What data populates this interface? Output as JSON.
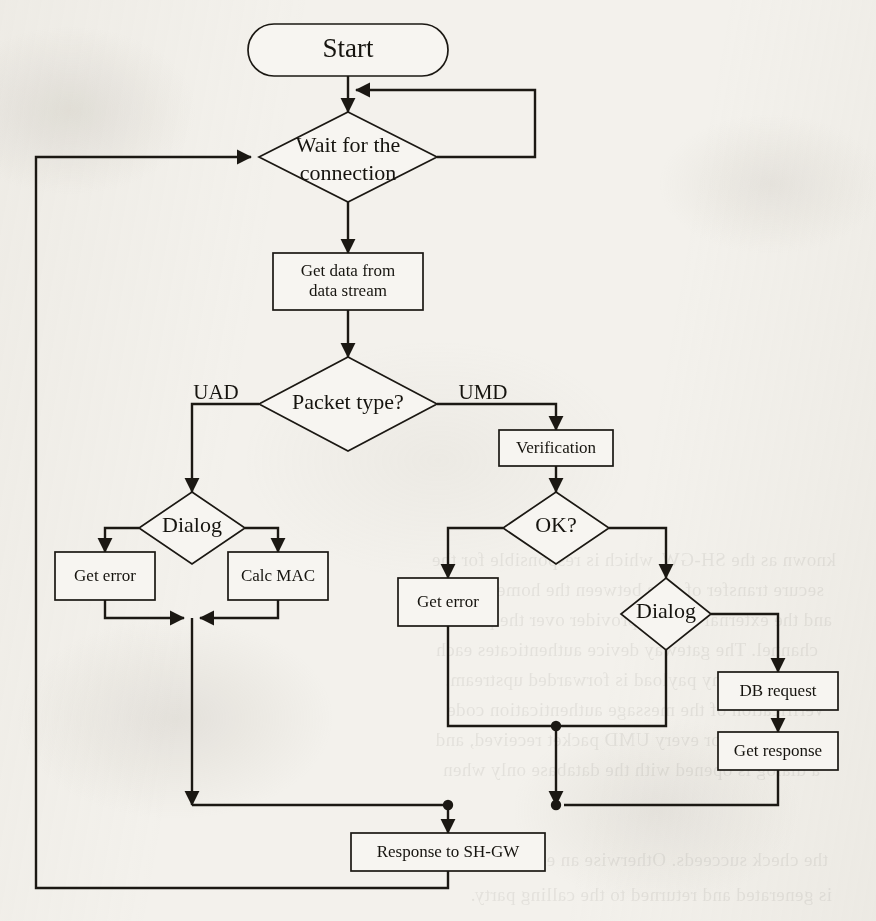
{
  "diagram": {
    "type": "flowchart",
    "colors": {
      "ink": "#1b1813",
      "paper": "#f3f1ec",
      "node_fill": "#f7f5f1"
    },
    "nodes": {
      "start": {
        "label": "Start",
        "shape": "terminator"
      },
      "wait": {
        "label_line1": "Wait for the",
        "label_line2": "connection",
        "shape": "decision"
      },
      "get_data": {
        "label_line1": "Get data from",
        "label_line2": "data stream",
        "shape": "process"
      },
      "packet_type": {
        "label": "Packet type?",
        "shape": "decision"
      },
      "dialog_left": {
        "label": "Dialog",
        "shape": "decision"
      },
      "get_error_left": {
        "label": "Get error",
        "shape": "process"
      },
      "calc_mac": {
        "label": "Calc MAC",
        "shape": "process"
      },
      "verification": {
        "label": "Verification",
        "shape": "process"
      },
      "ok": {
        "label": "OK?",
        "shape": "decision"
      },
      "get_error_right": {
        "label": "Get error",
        "shape": "process"
      },
      "dialog_right": {
        "label": "Dialog",
        "shape": "decision"
      },
      "db_request": {
        "label": "DB request",
        "shape": "process"
      },
      "get_response": {
        "label": "Get response",
        "shape": "process"
      },
      "response_shgw": {
        "label": "Response to SH-GW",
        "shape": "process"
      }
    },
    "edge_labels": {
      "uad": "UAD",
      "umd": "UMD"
    }
  },
  "background_text": {
    "lines": [
      "known as the SH-GW, which is responsible for the",
      "secure transfer of data between the home network",
      "and the external service provider over the public",
      "channel. The gateway device authenticates each",
      "node before any payload is forwarded upstream.",
      "Verification of the message authentication code",
      "is performed for every UMD packet received, and",
      "a dialog is opened with the database only when",
      "the check succeeds. Otherwise an error response",
      "is generated and returned to the calling party."
    ]
  }
}
